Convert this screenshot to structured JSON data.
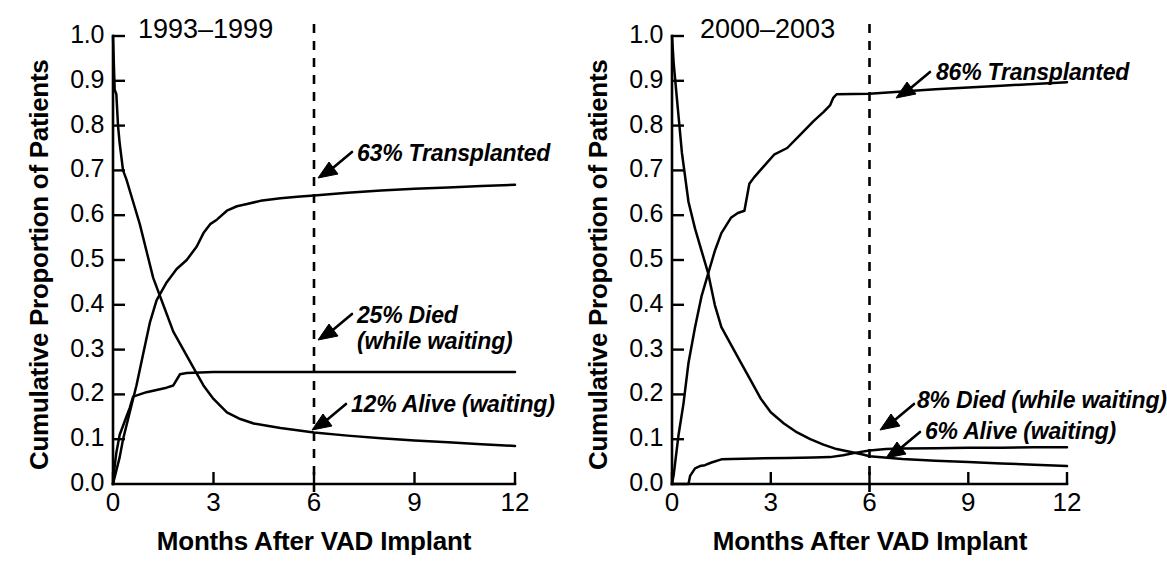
{
  "figure": {
    "axis_title": "Months After VAD Implant",
    "y_axis_label": "Cumulative Proportion of Patients",
    "y_tick_labels": [
      "1.0",
      "0.9",
      "0.8",
      "0.7",
      "0.6",
      "0.5",
      "0.4",
      "0.3",
      "0.2",
      "0.1",
      "0.0"
    ],
    "x_tick_labels": [
      "0",
      "3",
      "6",
      "9",
      "12"
    ],
    "reference_line_month": "6",
    "line_color": "#000000",
    "background_color": "#ffffff"
  },
  "panels": [
    {
      "title": "1993–1999",
      "annotations": [
        {
          "name": "transplanted",
          "line1": "63% Transplanted",
          "line2": ""
        },
        {
          "name": "died",
          "line1": "25% Died",
          "line2": "(while waiting)"
        },
        {
          "name": "alive",
          "line1": "12% Alive (waiting)",
          "line2": ""
        }
      ]
    },
    {
      "title": "2000–2003",
      "annotations": [
        {
          "name": "transplanted",
          "line1": "86% Transplanted",
          "line2": ""
        },
        {
          "name": "died",
          "line1": "8% Died (while waiting)",
          "line2": ""
        },
        {
          "name": "alive",
          "line1": "6% Alive (waiting)",
          "line2": ""
        }
      ]
    }
  ],
  "chart_data": {
    "type": "line",
    "xlabel": "Months After VAD Implant",
    "ylabel": "Cumulative Proportion of Patients",
    "xlim": [
      0,
      12
    ],
    "ylim": [
      0.0,
      1.0
    ],
    "xticks": [
      0,
      3,
      6,
      9,
      12
    ],
    "yticks": [
      0.0,
      0.1,
      0.2,
      0.3,
      0.4,
      0.5,
      0.6,
      0.7,
      0.8,
      0.9,
      1.0
    ],
    "grid": false,
    "legend": "inline annotations with arrows",
    "reference_lines": [
      {
        "orientation": "vertical",
        "x": 6,
        "style": "dashed"
      }
    ],
    "panels": [
      {
        "panel_title": "1993–1999",
        "annotations_at_6_months": {
          "transplanted": 0.63,
          "died_while_waiting": 0.25,
          "alive_waiting": 0.12
        },
        "series": [
          {
            "name": "Alive (waiting)",
            "x": [
              0.0,
              0.05,
              0.1,
              0.15,
              0.2,
              0.3,
              0.4,
              0.6,
              0.8,
              1.0,
              1.2,
              1.5,
              1.8,
              2.1,
              2.4,
              2.7,
              3.0,
              3.4,
              3.8,
              4.2,
              4.6,
              5.0,
              5.5,
              6.0,
              7.0,
              8.0,
              9.0,
              10.0,
              11.0,
              12.0
            ],
            "y": [
              1.0,
              0.88,
              0.87,
              0.8,
              0.76,
              0.7,
              0.68,
              0.63,
              0.58,
              0.52,
              0.46,
              0.4,
              0.34,
              0.3,
              0.26,
              0.22,
              0.19,
              0.16,
              0.145,
              0.135,
              0.13,
              0.125,
              0.12,
              0.115,
              0.108,
              0.102,
              0.097,
              0.093,
              0.089,
              0.085
            ]
          },
          {
            "name": "Transplanted",
            "x": [
              0.0,
              0.1,
              0.2,
              0.3,
              0.5,
              0.7,
              0.9,
              1.1,
              1.3,
              1.6,
              1.9,
              2.2,
              2.5,
              2.7,
              2.9,
              3.1,
              3.4,
              3.7,
              4.0,
              4.4,
              5.0,
              5.5,
              6.0,
              7.0,
              8.0,
              9.0,
              10.0,
              11.0,
              12.0
            ],
            "y": [
              0.0,
              0.03,
              0.06,
              0.1,
              0.16,
              0.22,
              0.29,
              0.36,
              0.41,
              0.45,
              0.48,
              0.5,
              0.53,
              0.56,
              0.58,
              0.59,
              0.61,
              0.62,
              0.625,
              0.632,
              0.638,
              0.641,
              0.644,
              0.65,
              0.655,
              0.659,
              0.662,
              0.665,
              0.668
            ]
          },
          {
            "name": "Died (while waiting)",
            "x": [
              0.0,
              0.05,
              0.1,
              0.2,
              0.3,
              0.4,
              0.5,
              0.6,
              0.8,
              1.0,
              1.3,
              1.6,
              1.8,
              2.0,
              2.2,
              2.6,
              3.0,
              6.0,
              9.0,
              12.0
            ],
            "y": [
              0.0,
              0.04,
              0.07,
              0.11,
              0.13,
              0.15,
              0.17,
              0.195,
              0.2,
              0.205,
              0.21,
              0.215,
              0.22,
              0.245,
              0.248,
              0.249,
              0.25,
              0.25,
              0.25,
              0.25
            ]
          }
        ]
      },
      {
        "panel_title": "2000–2003",
        "annotations_at_6_months": {
          "transplanted": 0.86,
          "died_while_waiting": 0.08,
          "alive_waiting": 0.06
        },
        "series": [
          {
            "name": "Alive (waiting)",
            "x": [
              0.0,
              0.05,
              0.1,
              0.2,
              0.3,
              0.5,
              0.7,
              0.9,
              1.1,
              1.3,
              1.5,
              1.8,
              2.1,
              2.4,
              2.7,
              3.0,
              3.4,
              3.8,
              4.2,
              4.6,
              5.0,
              5.4,
              5.8,
              6.0,
              7.0,
              8.0,
              9.0,
              10.0,
              11.0,
              12.0
            ],
            "y": [
              1.0,
              0.94,
              0.9,
              0.82,
              0.74,
              0.63,
              0.57,
              0.52,
              0.47,
              0.4,
              0.35,
              0.31,
              0.27,
              0.23,
              0.19,
              0.16,
              0.135,
              0.115,
              0.1,
              0.088,
              0.078,
              0.072,
              0.066,
              0.062,
              0.056,
              0.052,
              0.049,
              0.046,
              0.043,
              0.04
            ]
          },
          {
            "name": "Transplanted",
            "x": [
              0.0,
              0.05,
              0.1,
              0.2,
              0.35,
              0.5,
              0.7,
              0.9,
              1.1,
              1.3,
              1.5,
              1.8,
              2.0,
              2.2,
              2.35,
              2.5,
              2.8,
              3.1,
              3.5,
              3.9,
              4.3,
              4.6,
              4.8,
              4.9,
              5.0,
              6.0,
              7.0,
              8.0,
              9.0,
              10.0,
              11.0,
              12.0
            ],
            "y": [
              0.0,
              0.02,
              0.05,
              0.11,
              0.18,
              0.27,
              0.35,
              0.42,
              0.47,
              0.52,
              0.56,
              0.595,
              0.605,
              0.61,
              0.67,
              0.685,
              0.71,
              0.735,
              0.75,
              0.78,
              0.81,
              0.83,
              0.845,
              0.862,
              0.87,
              0.871,
              0.876,
              0.881,
              0.885,
              0.889,
              0.893,
              0.897
            ]
          },
          {
            "name": "Died (while waiting)",
            "x": [
              0.0,
              0.5,
              0.55,
              0.7,
              0.85,
              1.0,
              1.2,
              1.5,
              1.8,
              2.5,
              3.5,
              4.3,
              4.8,
              5.2,
              5.6,
              6.0,
              6.5,
              7.0,
              8.0,
              9.0,
              10.0,
              11.0,
              12.0
            ],
            "y": [
              0.0,
              0.0,
              0.018,
              0.035,
              0.04,
              0.042,
              0.048,
              0.055,
              0.056,
              0.057,
              0.058,
              0.059,
              0.06,
              0.064,
              0.07,
              0.075,
              0.078,
              0.079,
              0.08,
              0.081,
              0.081,
              0.082,
              0.082
            ]
          }
        ]
      }
    ]
  }
}
